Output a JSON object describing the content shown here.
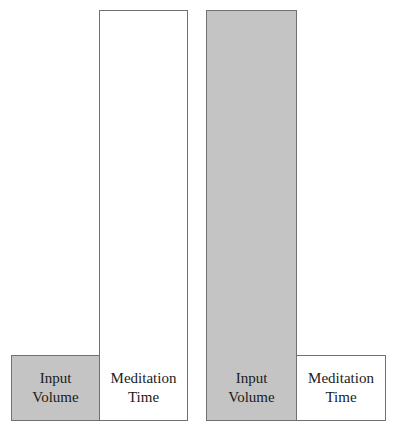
{
  "diagram": {
    "groups": [
      {
        "bars": [
          {
            "line1": "Input",
            "line2": "Volume",
            "relative_height": "short",
            "fill": "#c4c4c4"
          },
          {
            "line1": "Meditation",
            "line2": "Time",
            "relative_height": "tall",
            "fill": "#ffffff"
          }
        ]
      },
      {
        "bars": [
          {
            "line1": "Input",
            "line2": "Volume",
            "relative_height": "tall",
            "fill": "#c4c4c4"
          },
          {
            "line1": "Meditation",
            "line2": "Time",
            "relative_height": "short",
            "fill": "#ffffff"
          }
        ]
      }
    ]
  }
}
